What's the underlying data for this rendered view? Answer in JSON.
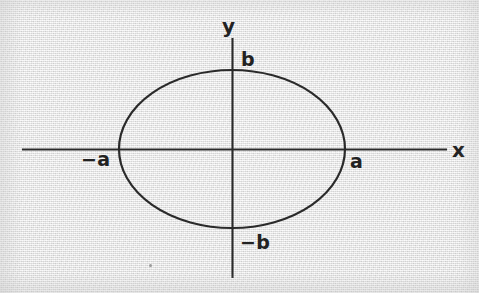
{
  "figure": {
    "kind": "ellipse-diagram",
    "background_color": "#e9e9e9",
    "ink_color": "#2a2a2a"
  },
  "axes": {
    "x_axis": {
      "name": "x-axis",
      "label": "x",
      "start_x": 22,
      "end_x": 447,
      "y": 149
    },
    "y_axis": {
      "name": "y-axis",
      "label": "y",
      "x": 232,
      "start_y": 38,
      "end_y": 278
    },
    "origin": {
      "x": 232,
      "y": 149
    }
  },
  "curve": {
    "name": "ellipse",
    "center_x": 232,
    "center_y": 149,
    "semi_major_a": 113,
    "semi_minor_b": 79
  },
  "labels": {
    "y_axis_name": "y",
    "x_axis_name": "x",
    "b_positive": "b",
    "b_negative": "−b",
    "a_positive": "a",
    "a_negative": "−a"
  },
  "chart_data": {
    "type": "line",
    "title": "",
    "xlabel": "x",
    "ylabel": "y",
    "grid": false,
    "legend": "none",
    "annotations": [
      "b",
      "−b",
      "a",
      "−a"
    ],
    "series": [
      {
        "name": "ellipse",
        "equation": "x^2/a^2 + y^2/b^2 = 1",
        "intercepts": {
          "x": [
            "−a",
            "a"
          ],
          "y": [
            "−b",
            "b"
          ]
        }
      }
    ],
    "xlim": [
      "−a",
      "a"
    ],
    "ylim": [
      "−b",
      "b"
    ]
  }
}
